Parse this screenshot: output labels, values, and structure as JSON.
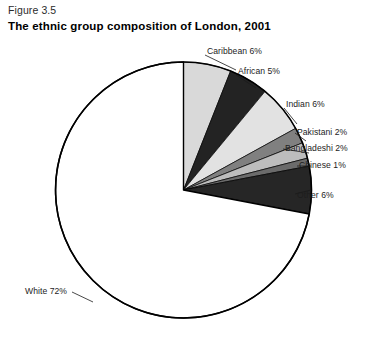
{
  "figure": {
    "number": "Figure 3.5",
    "title": "The ethnic group composition of London, 2001"
  },
  "chart_data": {
    "type": "pie",
    "title": "The ethnic group composition of London, 2001",
    "unit": "percent",
    "start_angle_deg": 0,
    "direction": "clockwise",
    "total": 100,
    "categories": [
      "Caribbean",
      "African",
      "Indian",
      "Pakistani",
      "Bangladeshi",
      "Chinese",
      "Other",
      "White"
    ],
    "values": [
      6,
      5,
      6,
      2,
      2,
      1,
      6,
      72
    ],
    "labels": [
      "Caribbean 6%",
      "African 5%",
      "Indian 6%",
      "Pakistani 2%",
      "Bangladeshi 2%",
      "Chinese 1%",
      "Other 6%",
      "White 72%"
    ],
    "slice_colors": [
      "#d9d9d9",
      "#232323",
      "#e2e2e2",
      "#808080",
      "#bdbdbd",
      "#6b6b6b",
      "#262626",
      "#ffffff"
    ],
    "stroke_color": "#000000",
    "legend": "none",
    "grid": false
  },
  "slices": [
    {
      "name": "Caribbean",
      "label": "Caribbean 6%",
      "value": 6,
      "color": "#d9d9d9",
      "label_x": 207,
      "label_y": 46,
      "side": "right",
      "leader": [
        236,
        70,
        205,
        55
      ]
    },
    {
      "name": "African",
      "label": "African 5%",
      "value": 5,
      "color": "#232323",
      "label_x": 238,
      "label_y": 66,
      "side": "right",
      "leader": [
        256,
        88,
        236,
        75
      ]
    },
    {
      "name": "Indian",
      "label": "Indian 6%",
      "value": 6,
      "color": "#e2e2e2",
      "label_x": 286,
      "label_y": 99,
      "side": "right",
      "leader": [
        297,
        124,
        284,
        108
      ]
    },
    {
      "name": "Pakistani",
      "label": "Pakistani 2%",
      "value": 2,
      "color": "#808080",
      "label_x": 297,
      "label_y": 127,
      "side": "right",
      "leader": [
        306,
        141,
        295,
        133
      ]
    },
    {
      "name": "Bangladeshi",
      "label": "Bangladeshi 2%",
      "value": 2,
      "color": "#bdbdbd",
      "label_x": 285,
      "label_y": 143,
      "side": "right",
      "leader": [
        309,
        153,
        283,
        149
      ]
    },
    {
      "name": "Chinese",
      "label": "Chinese 1%",
      "value": 1,
      "color": "#6b6b6b",
      "label_x": 299,
      "label_y": 160,
      "side": "right",
      "leader": [
        311,
        166,
        297,
        166
      ]
    },
    {
      "name": "Other",
      "label": "Other 6%",
      "value": 6,
      "color": "#262626",
      "label_x": 297,
      "label_y": 190,
      "side": "right",
      "leader": [
        311,
        190,
        295,
        194
      ]
    },
    {
      "name": "White",
      "label": "White 72%",
      "value": 72,
      "color": "#ffffff",
      "label_x": 25,
      "label_y": 286,
      "side": "left",
      "leader": [
        93,
        302,
        72,
        292
      ]
    }
  ]
}
